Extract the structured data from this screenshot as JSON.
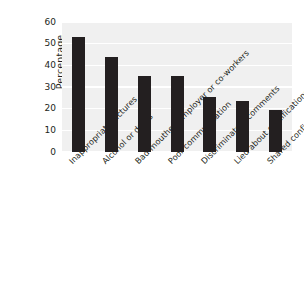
{
  "chart_data": {
    "type": "bar",
    "title": "",
    "xlabel": "",
    "ylabel": "Percentage",
    "ylim": [
      0,
      60
    ],
    "yticks": [
      0,
      10,
      20,
      30,
      40,
      50,
      60
    ],
    "grid": true,
    "legend": "none",
    "bar_color": "#231f20",
    "plot_background": "#f0f0f0",
    "gridline_color": "#ffffff",
    "categories": [
      "Inappropriate pictures",
      "Alcohol or drugs",
      "Bad-mouthed employer or co-workers",
      "Poor communication",
      "Discriminatory comments",
      "Lied about qualifications",
      "Shared confidential information"
    ],
    "values": [
      53,
      44,
      35,
      35,
      25.5,
      23.5,
      19.5
    ]
  }
}
